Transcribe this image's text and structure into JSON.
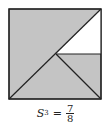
{
  "figure": {
    "square": {
      "x": 9,
      "y": 9,
      "size": 92
    },
    "colors": {
      "shaded": "#c4c4c4",
      "unshaded": "#ffffff",
      "stroke": "#222222"
    },
    "center": {
      "x": 55,
      "y": 54
    },
    "shaded_fraction": "7/8"
  },
  "caption": {
    "label": "S",
    "subscript": "3",
    "equals": "=",
    "numerator": "7",
    "denominator": "8"
  }
}
